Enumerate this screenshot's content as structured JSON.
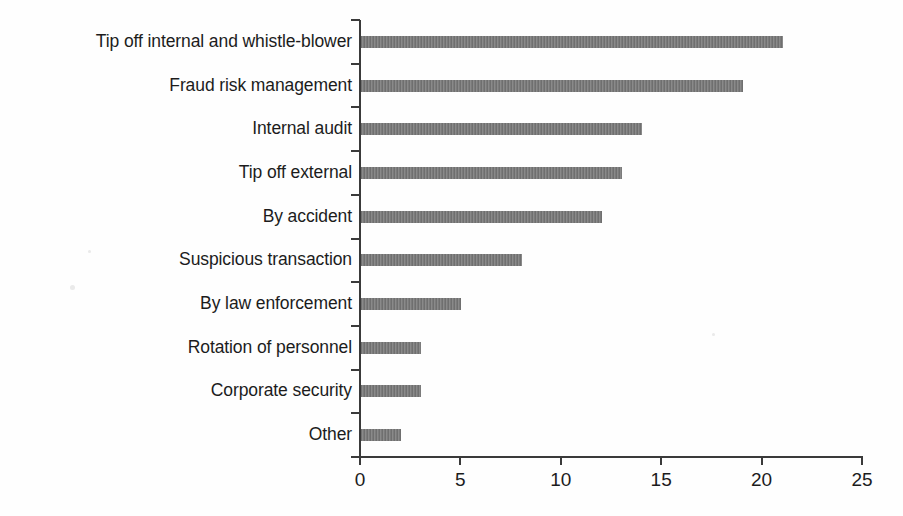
{
  "chart_data": {
    "type": "bar",
    "orientation": "horizontal",
    "title": "",
    "subtitle": "",
    "xlabel": "",
    "ylabel": "",
    "categories": [
      "Tip off internal and whistle-blower",
      "Fraud risk management",
      "Internal audit",
      "Tip off external",
      "By accident",
      "Suspicious transaction",
      "By law enforcement",
      "Rotation of personnel",
      "Corporate security",
      "Other"
    ],
    "values": [
      21,
      19,
      14,
      13,
      12,
      8,
      5,
      3,
      3,
      2
    ],
    "xlim": [
      0,
      25
    ],
    "xticks": [
      0,
      5,
      10,
      15,
      20,
      25
    ],
    "xtick_labels": [
      "0",
      "5",
      "10",
      "15",
      "20",
      "25"
    ],
    "grid": false,
    "legend": false,
    "bar_color": "#7d7d7d",
    "axis_color": "#3a3a3a",
    "background_color": "#ffffff"
  }
}
